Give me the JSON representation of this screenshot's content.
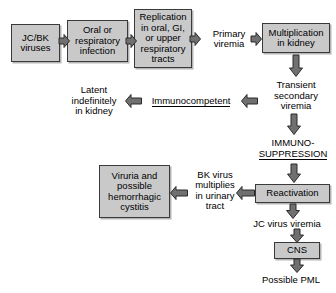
{
  "diagram": {
    "colors": {
      "box_fill": "#c9c9c9",
      "box_border": "#3a3a3a",
      "arrow_fill": "#707070",
      "arrow_stroke": "#2b2b2b",
      "background": "#ffffff",
      "text": "#000000"
    },
    "nodes": [
      {
        "id": "jc_bk_viruses",
        "label": "JC/BK\nviruses"
      },
      {
        "id": "oral_respiratory_infection",
        "label": "Oral or\nrespiratory\ninfection"
      },
      {
        "id": "replication_tracts",
        "label": "Replication\nin oral, GI,\nor upper\nrespiratory\ntracts"
      },
      {
        "id": "multiplication_kidney",
        "label": "Multiplication\nin kidney"
      },
      {
        "id": "viruria_cystitis",
        "label": "Viruria and\npossible\nhemorrhagic\ncystitis"
      },
      {
        "id": "reactivation",
        "label": "Reactivation"
      },
      {
        "id": "cns",
        "label": "CNS"
      }
    ],
    "labels": [
      {
        "id": "primary_viremia",
        "label": "Primary\nviremia",
        "underlined": false
      },
      {
        "id": "transient_secondary_viremia",
        "label": "Transient\nsecondary\nviremia",
        "underlined": false
      },
      {
        "id": "immunocompetent",
        "label": "Immunocompetent",
        "underlined": true
      },
      {
        "id": "latent_in_kidney",
        "label": "Latent\nindefinitely\nin kidney",
        "underlined": false
      },
      {
        "id": "immunosuppression",
        "label": "IMMUNO-\nSUPPRESSION",
        "underlined": true
      },
      {
        "id": "bk_virus_urinary",
        "label": "BK virus\nmultiplies\nin urinary\ntract",
        "underlined": false
      },
      {
        "id": "jc_virus_viremia",
        "label": "JC virus viremia",
        "underlined": false
      },
      {
        "id": "possible_pml",
        "label": "Possible PML",
        "underlined": false
      }
    ],
    "arrows": [
      {
        "id": "viruses-to-infection",
        "direction": "right"
      },
      {
        "id": "infection-to-replication",
        "direction": "right"
      },
      {
        "id": "replication-to-primary-viremia",
        "direction": "right"
      },
      {
        "id": "primary-viremia-to-multiplication",
        "direction": "right"
      },
      {
        "id": "multiplication-to-transient",
        "direction": "down"
      },
      {
        "id": "transient-to-immunocompetent",
        "direction": "left"
      },
      {
        "id": "immunocompetent-to-latent",
        "direction": "left"
      },
      {
        "id": "transient-to-immunosuppression",
        "direction": "down"
      },
      {
        "id": "immunosuppression-to-reactivation",
        "direction": "down"
      },
      {
        "id": "reactivation-to-bk-urinary",
        "direction": "left"
      },
      {
        "id": "bk-urinary-to-viruria",
        "direction": "left"
      },
      {
        "id": "reactivation-to-jc-viremia",
        "direction": "down"
      },
      {
        "id": "jc-viremia-to-cns",
        "direction": "down"
      },
      {
        "id": "cns-to-pml",
        "direction": "down"
      }
    ]
  }
}
